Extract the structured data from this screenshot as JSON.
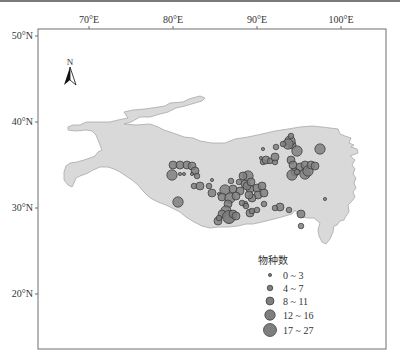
{
  "map": {
    "frame": {
      "left": 38,
      "top": 29,
      "right": 386,
      "bottom": 349
    },
    "lon_ticks": [
      {
        "label": "70°E",
        "x": 89
      },
      {
        "label": "80°E",
        "x": 173
      },
      {
        "label": "90°E",
        "x": 257
      },
      {
        "label": "100°E",
        "x": 341
      }
    ],
    "lat_ticks": [
      {
        "label": "50°N",
        "y": 36
      },
      {
        "label": "40°N",
        "y": 122
      },
      {
        "label": "30°N",
        "y": 208
      },
      {
        "label": "20°N",
        "y": 294
      }
    ],
    "north_arrow": {
      "label": "N"
    },
    "region_fill": "#d9d9d9",
    "region_stroke": "#a8a8a8",
    "point_fill": "#7f7f7f",
    "point_stroke": "#333333"
  },
  "legend": {
    "title": "物种数",
    "items": [
      {
        "label": "0 ~ 3",
        "r": 1.6
      },
      {
        "label": "4 ~ 7",
        "r": 2.8
      },
      {
        "label": "8 ~ 11",
        "r": 4.0
      },
      {
        "label": "12 ~ 16",
        "r": 5.2
      },
      {
        "label": "17 ~ 27",
        "r": 6.5
      }
    ]
  },
  "chart_data": {
    "type": "scatter",
    "title": "",
    "xlabel": "Longitude",
    "ylabel": "Latitude",
    "x_ticks": [
      "70°E",
      "80°E",
      "90°E",
      "100°E"
    ],
    "y_ticks": [
      "20°N",
      "30°N",
      "40°N",
      "50°N"
    ],
    "legend_title": "物种数",
    "size_classes": [
      "0 ~ 3",
      "4 ~ 7",
      "8 ~ 11",
      "12 ~ 16",
      "17 ~ 27"
    ],
    "points_note": "Bubble map of species counts across the Qinghai-Tibet Plateau; points given as [x_px, y_px, size_class_index]",
    "points": [
      [
        173,
        165,
        2
      ],
      [
        180,
        165,
        2
      ],
      [
        187,
        165,
        2
      ],
      [
        192,
        166,
        2
      ],
      [
        195,
        171,
        2
      ],
      [
        197,
        176,
        1
      ],
      [
        172,
        175,
        3
      ],
      [
        180,
        174,
        0
      ],
      [
        184,
        174,
        0
      ],
      [
        194,
        186,
        1
      ],
      [
        200,
        186,
        2
      ],
      [
        178,
        202,
        3
      ],
      [
        209,
        186,
        1
      ],
      [
        212,
        193,
        2
      ],
      [
        219,
        194,
        0
      ],
      [
        212,
        180,
        0
      ],
      [
        225,
        190,
        3
      ],
      [
        222,
        197,
        2
      ],
      [
        230,
        198,
        3
      ],
      [
        228,
        204,
        2
      ],
      [
        226,
        211,
        3
      ],
      [
        222,
        214,
        2
      ],
      [
        218,
        221,
        2
      ],
      [
        229,
        218,
        3
      ],
      [
        229,
        217,
        4
      ],
      [
        219,
        218,
        1
      ],
      [
        231,
        181,
        1
      ],
      [
        239,
        182,
        1
      ],
      [
        245,
        184,
        2
      ],
      [
        233,
        189,
        2
      ],
      [
        240,
        191,
        2
      ],
      [
        236,
        196,
        2
      ],
      [
        250,
        189,
        2
      ],
      [
        257,
        188,
        2
      ],
      [
        262,
        186,
        2
      ],
      [
        258,
        195,
        2
      ],
      [
        264,
        193,
        2
      ],
      [
        252,
        198,
        2
      ],
      [
        249,
        195,
        2
      ],
      [
        247,
        186,
        2
      ],
      [
        248,
        176,
        3
      ],
      [
        251,
        182,
        2
      ],
      [
        243,
        176,
        2
      ],
      [
        245,
        204,
        1
      ],
      [
        242,
        203,
        1
      ],
      [
        250,
        213,
        2
      ],
      [
        233,
        214,
        2
      ],
      [
        236,
        216,
        2
      ],
      [
        263,
        162,
        1
      ],
      [
        261,
        158,
        0
      ],
      [
        266,
        160,
        2
      ],
      [
        270,
        161,
        1
      ],
      [
        275,
        162,
        1
      ],
      [
        275,
        157,
        2
      ],
      [
        263,
        149,
        0
      ],
      [
        276,
        147,
        1
      ],
      [
        292,
        145,
        2
      ],
      [
        290,
        141,
        3
      ],
      [
        288,
        144,
        3
      ],
      [
        291,
        136,
        1
      ],
      [
        297,
        151,
        3
      ],
      [
        283,
        144,
        1
      ],
      [
        252,
        211,
        1
      ],
      [
        257,
        210,
        1
      ],
      [
        246,
        206,
        1
      ],
      [
        291,
        160,
        2
      ],
      [
        293,
        165,
        2
      ],
      [
        295,
        172,
        2
      ],
      [
        292,
        175,
        3
      ],
      [
        300,
        167,
        2
      ],
      [
        305,
        165,
        2
      ],
      [
        305,
        174,
        3
      ],
      [
        308,
        171,
        3
      ],
      [
        311,
        165,
        2
      ],
      [
        315,
        166,
        2
      ],
      [
        297,
        172,
        1
      ],
      [
        320,
        149,
        3
      ],
      [
        325,
        199,
        0
      ],
      [
        289,
        210,
        1
      ],
      [
        301,
        214,
        2
      ],
      [
        301,
        226,
        1
      ],
      [
        192,
        174,
        0
      ],
      [
        264,
        204,
        1
      ],
      [
        280,
        207,
        2
      ],
      [
        275,
        208,
        1
      ]
    ]
  }
}
